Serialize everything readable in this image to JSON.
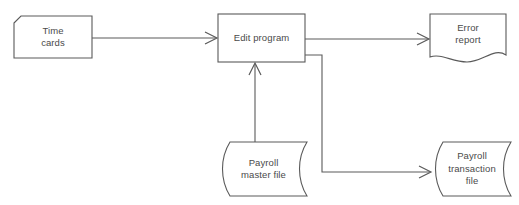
{
  "diagram": {
    "background_color": "#ffffff",
    "line_color": "#5a5a5a",
    "text_color": "#4a4a4a",
    "nodes": [
      {
        "id": "time-cards",
        "label_line1": "Time",
        "label_line2": "cards",
        "symbol": "punched-card",
        "x": 14,
        "y": 16,
        "width": 78,
        "height": 42
      },
      {
        "id": "edit-program",
        "label_line1": "Edit program",
        "label_line2": "",
        "symbol": "process-rectangle",
        "x": 218,
        "y": 14,
        "width": 87,
        "height": 48
      },
      {
        "id": "error-report",
        "label_line1": "Error",
        "label_line2": "report",
        "symbol": "document",
        "x": 430,
        "y": 14,
        "width": 76,
        "height": 48
      },
      {
        "id": "payroll-master-file",
        "label_line1": "Payroll",
        "label_line2": "master file",
        "symbol": "stored-data-file",
        "x": 219,
        "y": 142,
        "width": 88,
        "height": 54
      },
      {
        "id": "payroll-transaction-file",
        "label_line1": "Payroll",
        "label_line2": "transaction",
        "label_line3": "file",
        "symbol": "stored-data-file",
        "x": 432,
        "y": 142,
        "width": 79,
        "height": 54
      }
    ],
    "connectors": [
      {
        "id": "time-cards-to-edit-program",
        "from": "time-cards",
        "to": "edit-program",
        "arrow": true
      },
      {
        "id": "edit-program-to-error-report",
        "from": "edit-program",
        "to": "error-report",
        "arrow": true
      },
      {
        "id": "payroll-master-file-to-edit-program",
        "from": "payroll-master-file",
        "to": "edit-program",
        "arrow": true
      },
      {
        "id": "edit-program-to-payroll-transaction-file",
        "from": "edit-program",
        "to": "payroll-transaction-file",
        "arrow": true
      }
    ]
  }
}
